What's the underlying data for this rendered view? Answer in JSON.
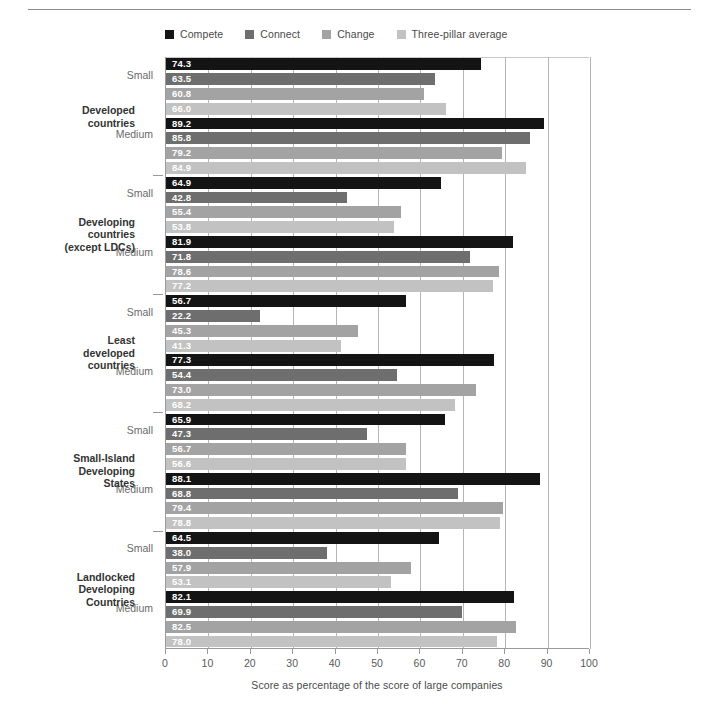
{
  "chart_data": {
    "type": "bar",
    "orientation": "horizontal",
    "title": "",
    "xlabel": "Score as percentage of the score of large companies",
    "ylabel": "",
    "xlim": [
      0,
      100
    ],
    "xticks": [
      0,
      10,
      20,
      30,
      40,
      50,
      60,
      70,
      80,
      90,
      100
    ],
    "grid": true,
    "legend_position": "top",
    "series": [
      {
        "name": "Compete",
        "color": "#141414"
      },
      {
        "name": "Connect",
        "color": "#6e6e6e"
      },
      {
        "name": "Change",
        "color": "#a3a3a3"
      },
      {
        "name": "Three-pillar average",
        "color": "#c2c2c2"
      }
    ],
    "groups": [
      {
        "category": "Developed countries",
        "subgroups": [
          {
            "size": "Small",
            "values": [
              74.3,
              63.5,
              60.8,
              66.0
            ]
          },
          {
            "size": "Medium",
            "values": [
              89.2,
              85.8,
              79.2,
              84.9
            ]
          }
        ]
      },
      {
        "category": "Developing countries (except LDCs)",
        "subgroups": [
          {
            "size": "Small",
            "values": [
              64.9,
              42.8,
              55.4,
              53.8
            ]
          },
          {
            "size": "Medium",
            "values": [
              81.9,
              71.8,
              78.6,
              77.2
            ]
          }
        ]
      },
      {
        "category": "Least developed countries",
        "subgroups": [
          {
            "size": "Small",
            "values": [
              56.7,
              22.2,
              45.3,
              41.3
            ]
          },
          {
            "size": "Medium",
            "values": [
              77.3,
              54.4,
              73.0,
              68.2
            ]
          }
        ]
      },
      {
        "category": "Small-Island Developing States",
        "subgroups": [
          {
            "size": "Small",
            "values": [
              65.9,
              47.3,
              56.7,
              56.6
            ]
          },
          {
            "size": "Medium",
            "values": [
              88.1,
              68.8,
              79.4,
              78.8
            ]
          }
        ]
      },
      {
        "category": "Landlocked Developing Countries",
        "subgroups": [
          {
            "size": "Small",
            "values": [
              64.5,
              38.0,
              57.9,
              53.1
            ]
          },
          {
            "size": "Medium",
            "values": [
              82.1,
              69.9,
              82.5,
              78.0
            ]
          }
        ]
      }
    ]
  },
  "legend": {
    "items": [
      {
        "label": "Compete"
      },
      {
        "label": "Connect"
      },
      {
        "label": "Change"
      },
      {
        "label": "Three-pillar average"
      }
    ]
  },
  "axis": {
    "x_title": "Score as percentage of the score of large companies",
    "x_tick_labels": [
      "0",
      "10",
      "20",
      "30",
      "40",
      "50",
      "60",
      "70",
      "80",
      "90",
      "100"
    ]
  },
  "categories": [
    {
      "label": "Developed countries",
      "lines": [
        "Developed",
        "countries"
      ]
    },
    {
      "label": "Developing countries (except LDCs)",
      "lines": [
        "Developing",
        "countries",
        "(except LDCs)"
      ]
    },
    {
      "label": "Least developed countries",
      "lines": [
        "Least",
        "developed",
        "countries"
      ]
    },
    {
      "label": "Small-Island Developing States",
      "lines": [
        "Small-Island",
        "Developing",
        "States"
      ]
    },
    {
      "label": "Landlocked Developing Countries",
      "lines": [
        "Landlocked",
        "Developing",
        "Countries"
      ]
    }
  ],
  "sizes": [
    "Small",
    "Medium"
  ]
}
